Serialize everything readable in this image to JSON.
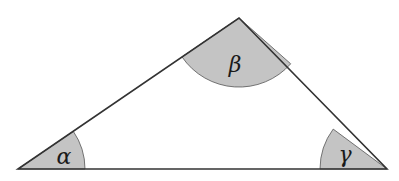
{
  "diagram": {
    "type": "triangle-angles",
    "vertices": {
      "A": {
        "x": 18,
        "y": 169
      },
      "B": {
        "x": 239,
        "y": 18
      },
      "C": {
        "x": 387,
        "y": 169
      }
    },
    "angles": [
      {
        "id": "alpha",
        "vertex": "A",
        "label": "α",
        "label_x": 64,
        "label_y": 164,
        "radius": 67
      },
      {
        "id": "beta",
        "vertex": "B",
        "label": "β",
        "label_x": 235,
        "label_y": 72,
        "radius": 69
      },
      {
        "id": "gamma",
        "vertex": "C",
        "label": "γ",
        "label_x": 345,
        "label_y": 162,
        "radius": 67
      }
    ],
    "colors": {
      "stroke": "#333333",
      "fill": "#c4c4c4",
      "background": "#ffffff"
    }
  }
}
